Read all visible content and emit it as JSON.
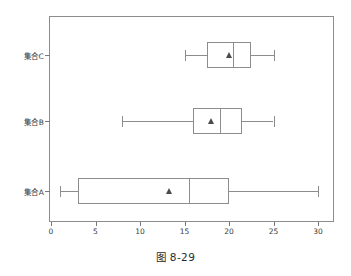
{
  "caption": "图 8-29",
  "chart_data": {
    "type": "box",
    "orientation": "horizontal",
    "title": "",
    "xlabel": "",
    "ylabel": "",
    "xlim": [
      0,
      31.5
    ],
    "xticks": [
      0,
      5,
      10,
      15,
      20,
      25,
      30
    ],
    "xtick_labels": [
      "0",
      "5",
      "10",
      "15",
      "20",
      "25",
      "30"
    ],
    "grid": false,
    "legend": false,
    "categories": [
      "集合A",
      "集合B",
      "集合C"
    ],
    "category_order_top_to_bottom": [
      "集合C",
      "集合B",
      "集合A"
    ],
    "mean_marker": "triangle",
    "boxes": [
      {
        "name": "集合A",
        "whisker_low": 1.0,
        "q1": 3.0,
        "median": 15.5,
        "q3": 20.0,
        "whisker_high": 30.0,
        "mean": 13.3
      },
      {
        "name": "集合B",
        "whisker_low": 8.0,
        "q1": 16.0,
        "median": 19.0,
        "q3": 21.5,
        "whisker_high": 25.0,
        "mean": 18.0
      },
      {
        "name": "集合C",
        "whisker_low": 15.0,
        "q1": 17.5,
        "median": 20.5,
        "q3": 22.5,
        "whisker_high": 25.0,
        "mean": 20.0
      }
    ]
  },
  "colors": {
    "line": "#8d8d8d",
    "marker": "#4a4a4a",
    "text": "#2b2b2b",
    "background": "#ffffff"
  }
}
